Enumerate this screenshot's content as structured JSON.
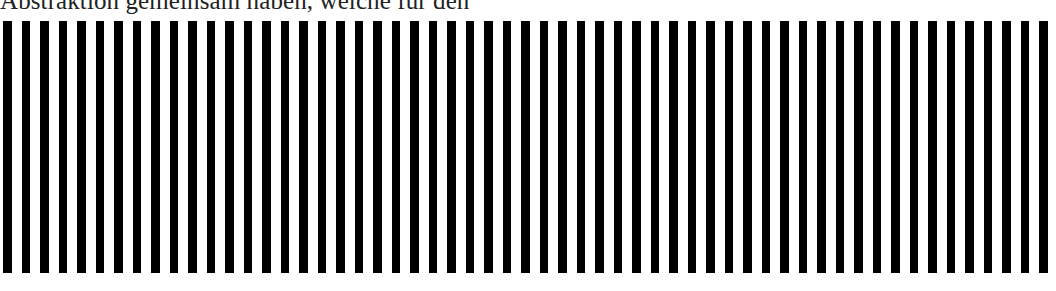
{
  "document": {
    "text_line": "Abstraktion gemeinsam haben, welche für den"
  },
  "pattern": {
    "type": "vertical-stripes",
    "stripe_count": 57,
    "start_x": 3,
    "period_px": 18.5,
    "stripe_width_px": 8.5,
    "top_px": 21,
    "height_px": 252,
    "stripe_color": "#000000",
    "background_color": "#ffffff"
  }
}
